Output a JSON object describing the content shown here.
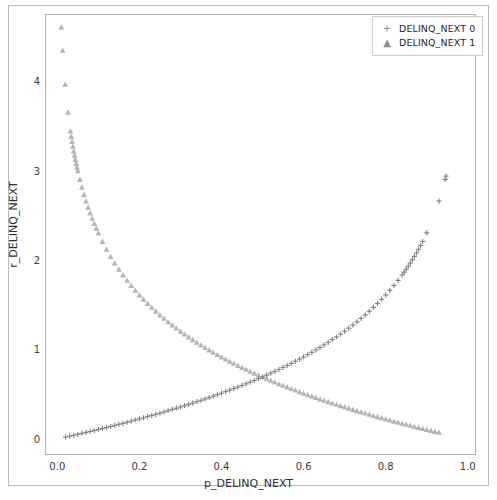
{
  "chart_data": {
    "type": "scatter",
    "title": "",
    "xlabel": "p_DELINQ_NEXT",
    "ylabel": "r_DELINQ_NEXT",
    "xlim": [
      -0.03,
      1.02
    ],
    "ylim": [
      -0.18,
      4.75
    ],
    "xticks": [
      "0.0",
      "0.2",
      "0.4",
      "0.6",
      "0.8",
      "1.0"
    ],
    "xtick_values": [
      0.0,
      0.2,
      0.4,
      0.6,
      0.8,
      1.0
    ],
    "yticks": [
      "0",
      "1",
      "2",
      "3",
      "4"
    ],
    "ytick_values": [
      0,
      1,
      2,
      3,
      4
    ],
    "grid": false,
    "legend_position": "upper right",
    "series": [
      {
        "name": "DELINQ_NEXT 0",
        "marker": "plus",
        "color": "#808080",
        "description": "increasing curve, y = -ln(1-p)",
        "points": [
          [
            0.02,
            0.02
          ],
          [
            0.03,
            0.03
          ],
          [
            0.04,
            0.041
          ],
          [
            0.05,
            0.051
          ],
          [
            0.06,
            0.062
          ],
          [
            0.07,
            0.073
          ],
          [
            0.08,
            0.083
          ],
          [
            0.09,
            0.094
          ],
          [
            0.1,
            0.105
          ],
          [
            0.11,
            0.117
          ],
          [
            0.12,
            0.128
          ],
          [
            0.13,
            0.139
          ],
          [
            0.14,
            0.151
          ],
          [
            0.15,
            0.163
          ],
          [
            0.16,
            0.174
          ],
          [
            0.17,
            0.186
          ],
          [
            0.18,
            0.198
          ],
          [
            0.19,
            0.211
          ],
          [
            0.2,
            0.223
          ],
          [
            0.21,
            0.236
          ],
          [
            0.22,
            0.248
          ],
          [
            0.23,
            0.261
          ],
          [
            0.24,
            0.274
          ],
          [
            0.25,
            0.288
          ],
          [
            0.26,
            0.301
          ],
          [
            0.27,
            0.315
          ],
          [
            0.28,
            0.329
          ],
          [
            0.29,
            0.343
          ],
          [
            0.3,
            0.357
          ],
          [
            0.31,
            0.371
          ],
          [
            0.32,
            0.386
          ],
          [
            0.33,
            0.4
          ],
          [
            0.34,
            0.416
          ],
          [
            0.35,
            0.431
          ],
          [
            0.36,
            0.446
          ],
          [
            0.37,
            0.462
          ],
          [
            0.38,
            0.478
          ],
          [
            0.39,
            0.494
          ],
          [
            0.4,
            0.511
          ],
          [
            0.41,
            0.528
          ],
          [
            0.42,
            0.545
          ],
          [
            0.43,
            0.562
          ],
          [
            0.44,
            0.58
          ],
          [
            0.45,
            0.598
          ],
          [
            0.46,
            0.616
          ],
          [
            0.47,
            0.635
          ],
          [
            0.48,
            0.654
          ],
          [
            0.49,
            0.673
          ],
          [
            0.5,
            0.693
          ],
          [
            0.51,
            0.713
          ],
          [
            0.52,
            0.734
          ],
          [
            0.53,
            0.755
          ],
          [
            0.54,
            0.777
          ],
          [
            0.55,
            0.799
          ],
          [
            0.56,
            0.821
          ],
          [
            0.57,
            0.844
          ],
          [
            0.58,
            0.868
          ],
          [
            0.59,
            0.892
          ],
          [
            0.6,
            0.916
          ],
          [
            0.61,
            0.942
          ],
          [
            0.62,
            0.968
          ],
          [
            0.63,
            0.994
          ],
          [
            0.64,
            1.022
          ],
          [
            0.65,
            1.05
          ],
          [
            0.66,
            1.079
          ],
          [
            0.67,
            1.109
          ],
          [
            0.68,
            1.139
          ],
          [
            0.69,
            1.171
          ],
          [
            0.7,
            1.204
          ],
          [
            0.71,
            1.238
          ],
          [
            0.72,
            1.273
          ],
          [
            0.73,
            1.309
          ],
          [
            0.74,
            1.347
          ],
          [
            0.75,
            1.386
          ],
          [
            0.76,
            1.427
          ],
          [
            0.77,
            1.47
          ],
          [
            0.78,
            1.514
          ],
          [
            0.79,
            1.561
          ],
          [
            0.8,
            1.609
          ],
          [
            0.81,
            1.661
          ],
          [
            0.82,
            1.715
          ],
          [
            0.83,
            1.772
          ],
          [
            0.84,
            1.833
          ],
          [
            0.845,
            1.864
          ],
          [
            0.85,
            1.897
          ],
          [
            0.855,
            1.931
          ],
          [
            0.86,
            1.966
          ],
          [
            0.865,
            2.003
          ],
          [
            0.87,
            2.04
          ],
          [
            0.875,
            2.079
          ],
          [
            0.88,
            2.12
          ],
          [
            0.885,
            2.163
          ],
          [
            0.89,
            2.207
          ],
          [
            0.9,
            2.303
          ],
          [
            0.93,
            2.659
          ],
          [
            0.945,
            2.9
          ],
          [
            0.947,
            2.938
          ]
        ]
      },
      {
        "name": "DELINQ_NEXT 1",
        "marker": "triangle",
        "color": "#b5b5ad",
        "description": "decreasing curve, y = -ln(p)",
        "points": [
          [
            0.01,
            4.605
          ],
          [
            0.013,
            4.343
          ],
          [
            0.019,
            3.963
          ],
          [
            0.026,
            3.65
          ],
          [
            0.032,
            3.442
          ],
          [
            0.034,
            3.381
          ],
          [
            0.036,
            3.324
          ],
          [
            0.038,
            3.27
          ],
          [
            0.04,
            3.219
          ],
          [
            0.042,
            3.17
          ],
          [
            0.044,
            3.124
          ],
          [
            0.046,
            3.079
          ],
          [
            0.048,
            3.036
          ],
          [
            0.05,
            2.996
          ],
          [
            0.055,
            2.9
          ],
          [
            0.06,
            2.813
          ],
          [
            0.065,
            2.733
          ],
          [
            0.07,
            2.659
          ],
          [
            0.075,
            2.59
          ],
          [
            0.08,
            2.526
          ],
          [
            0.085,
            2.465
          ],
          [
            0.09,
            2.408
          ],
          [
            0.095,
            2.354
          ],
          [
            0.1,
            2.303
          ],
          [
            0.11,
            2.207
          ],
          [
            0.12,
            2.12
          ],
          [
            0.13,
            2.04
          ],
          [
            0.14,
            1.966
          ],
          [
            0.15,
            1.897
          ],
          [
            0.16,
            1.833
          ],
          [
            0.17,
            1.772
          ],
          [
            0.18,
            1.715
          ],
          [
            0.19,
            1.661
          ],
          [
            0.2,
            1.609
          ],
          [
            0.21,
            1.561
          ],
          [
            0.22,
            1.514
          ],
          [
            0.23,
            1.47
          ],
          [
            0.24,
            1.427
          ],
          [
            0.25,
            1.386
          ],
          [
            0.26,
            1.347
          ],
          [
            0.27,
            1.309
          ],
          [
            0.28,
            1.273
          ],
          [
            0.29,
            1.238
          ],
          [
            0.3,
            1.204
          ],
          [
            0.31,
            1.171
          ],
          [
            0.32,
            1.139
          ],
          [
            0.33,
            1.109
          ],
          [
            0.34,
            1.079
          ],
          [
            0.35,
            1.05
          ],
          [
            0.36,
            1.022
          ],
          [
            0.37,
            0.994
          ],
          [
            0.38,
            0.968
          ],
          [
            0.39,
            0.942
          ],
          [
            0.4,
            0.916
          ],
          [
            0.41,
            0.892
          ],
          [
            0.42,
            0.868
          ],
          [
            0.43,
            0.844
          ],
          [
            0.44,
            0.821
          ],
          [
            0.45,
            0.799
          ],
          [
            0.46,
            0.777
          ],
          [
            0.47,
            0.755
          ],
          [
            0.48,
            0.734
          ],
          [
            0.49,
            0.713
          ],
          [
            0.5,
            0.693
          ],
          [
            0.51,
            0.673
          ],
          [
            0.52,
            0.654
          ],
          [
            0.53,
            0.635
          ],
          [
            0.54,
            0.616
          ],
          [
            0.55,
            0.598
          ],
          [
            0.56,
            0.58
          ],
          [
            0.57,
            0.562
          ],
          [
            0.58,
            0.545
          ],
          [
            0.59,
            0.528
          ],
          [
            0.6,
            0.511
          ],
          [
            0.61,
            0.494
          ],
          [
            0.62,
            0.478
          ],
          [
            0.63,
            0.462
          ],
          [
            0.64,
            0.446
          ],
          [
            0.65,
            0.431
          ],
          [
            0.66,
            0.416
          ],
          [
            0.67,
            0.4
          ],
          [
            0.68,
            0.386
          ],
          [
            0.69,
            0.371
          ],
          [
            0.7,
            0.357
          ],
          [
            0.71,
            0.343
          ],
          [
            0.72,
            0.329
          ],
          [
            0.73,
            0.315
          ],
          [
            0.74,
            0.301
          ],
          [
            0.75,
            0.288
          ],
          [
            0.76,
            0.274
          ],
          [
            0.77,
            0.261
          ],
          [
            0.78,
            0.248
          ],
          [
            0.79,
            0.236
          ],
          [
            0.8,
            0.223
          ],
          [
            0.81,
            0.211
          ],
          [
            0.82,
            0.198
          ],
          [
            0.83,
            0.186
          ],
          [
            0.84,
            0.174
          ],
          [
            0.85,
            0.163
          ],
          [
            0.86,
            0.151
          ],
          [
            0.87,
            0.139
          ],
          [
            0.88,
            0.128
          ],
          [
            0.89,
            0.117
          ],
          [
            0.9,
            0.105
          ],
          [
            0.91,
            0.094
          ],
          [
            0.92,
            0.083
          ],
          [
            0.93,
            0.073
          ]
        ]
      }
    ]
  },
  "legend": {
    "items": [
      {
        "marker_glyph": "+",
        "label": "DELINQ_NEXT 0"
      },
      {
        "marker_glyph": "▲",
        "label": "DELINQ_NEXT 1"
      }
    ]
  },
  "colors": {
    "series_0": "#808080",
    "series_1": "#b5b5ad",
    "axis_line": "#b0b0b0",
    "tick_text": "#3a3a3a",
    "background": "#ffffff"
  }
}
